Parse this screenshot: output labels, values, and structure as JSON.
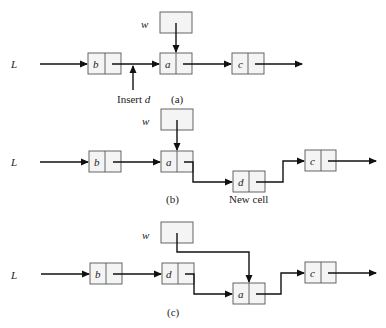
{
  "diagram": {
    "panels": [
      {
        "id": "a",
        "caption": "(a)",
        "list_label": "L",
        "pointer_label": "w",
        "cells": [
          "b",
          "a",
          "c"
        ],
        "annotation": "Insert d",
        "annotation_italic_part": "d"
      },
      {
        "id": "b",
        "caption": "(b)",
        "list_label": "L",
        "pointer_label": "w",
        "cells": [
          "b",
          "a",
          "d",
          "c"
        ],
        "annotation": "New cell"
      },
      {
        "id": "c",
        "caption": "(c)",
        "list_label": "L",
        "pointer_label": "w",
        "cells": [
          "b",
          "d",
          "a",
          "c"
        ]
      }
    ]
  }
}
